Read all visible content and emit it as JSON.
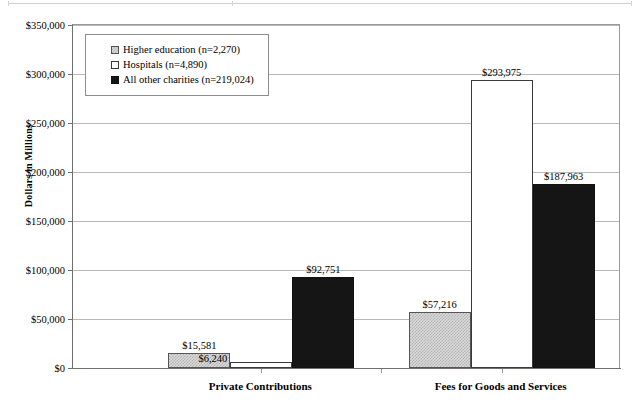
{
  "chart_data": {
    "type": "bar",
    "title": "",
    "xlabel": "",
    "ylabel": "Dollars in Millions",
    "ylim": [
      0,
      350000
    ],
    "ytick_labels": [
      "$0",
      "$50,000",
      "$100,000",
      "$150,000",
      "$200,000",
      "$250,000",
      "$300,000",
      "$350,000"
    ],
    "ytick_values": [
      0,
      50000,
      100000,
      150000,
      200000,
      250000,
      300000,
      350000
    ],
    "grid": true,
    "legend_position": "upper-left-inside",
    "categories": [
      "Private Contributions",
      "Fees for Goods and Services"
    ],
    "series": [
      {
        "name": "Higher education (n=2,270)",
        "key": "higher-education",
        "fill": "light-gray-dither",
        "values": [
          15581,
          57216
        ],
        "data_labels": [
          "$15,581",
          "$57,216"
        ]
      },
      {
        "name": "Hospitals (n=4,890)",
        "key": "hospitals",
        "fill": "white",
        "values": [
          6240,
          293975
        ],
        "data_labels": [
          "$6,240",
          "$293,975"
        ]
      },
      {
        "name": "All other charities (n=219,024)",
        "key": "all-other-charities",
        "fill": "black",
        "values": [
          92751,
          187963
        ],
        "data_labels": [
          "$92,751",
          "$187,963"
        ]
      }
    ]
  },
  "colors": {
    "axis": "#6f6f6f",
    "gridline": "#b9b9b9",
    "frame": "#9a9a9a",
    "series_higher_education": "#d9d9d9",
    "series_hospitals": "#ffffff",
    "series_all_other": "#151515",
    "text": "#000000"
  }
}
